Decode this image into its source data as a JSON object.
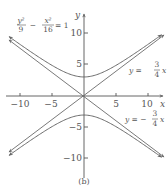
{
  "chart_data": {
    "type": "line",
    "title": "",
    "caption": "(b)",
    "xlabel": "x",
    "ylabel": "y",
    "xlim": [
      -12,
      12.5
    ],
    "ylim": [
      -12,
      12.5
    ],
    "x_ticks": [
      -10,
      -5,
      5,
      10
    ],
    "x_tick_labels": [
      "−10",
      "−5",
      "5",
      "10"
    ],
    "y_ticks": [
      10,
      5,
      -5,
      -10
    ],
    "y_tick_labels": [
      "10",
      "5",
      "−5",
      "−10"
    ],
    "grid": false,
    "series": [
      {
        "name": "y^2/9 - x^2/16 = 1",
        "kind": "hyperbola",
        "a": 3,
        "b": 4,
        "branches": [
          "upper",
          "lower"
        ],
        "vertices": [
          [
            0,
            3
          ],
          [
            0,
            -3
          ]
        ]
      },
      {
        "name": "y = (3/4)x",
        "kind": "asymptote",
        "slope": 0.75,
        "intercept": 0
      },
      {
        "name": "y = -(3/4)x",
        "kind": "asymptote",
        "slope": -0.75,
        "intercept": 0
      }
    ],
    "annotations": [
      {
        "text": "y²/9 − x²/16 = 1",
        "position": "upper-left"
      },
      {
        "text": "y = (3/4)x",
        "position": "right, above x-axis"
      },
      {
        "text": "y = −(3/4)x",
        "position": "right, below x-axis"
      }
    ]
  },
  "labels": {
    "equation_y_num": "y²",
    "equation_y_den": "9",
    "equation_minus": "−",
    "equation_x_num": "x²",
    "equation_x_den": "16",
    "equation_rhs": "= 1",
    "asym_pos_prefix": "y =",
    "asym_pos_num": "3",
    "asym_pos_den": "4",
    "asym_pos_var": "x",
    "asym_neg_prefix": "y = −",
    "asym_neg_num": "3",
    "asym_neg_den": "4",
    "asym_neg_var": "x",
    "x_axis": "x",
    "y_axis": "y",
    "caption": "(b)",
    "xt_m10": "−10",
    "xt_m5": "−5",
    "xt_5": "5",
    "xt_10": "10",
    "yt_10": "10",
    "yt_5": "5",
    "yt_m5": "−5",
    "yt_m10": "−10"
  },
  "colors": {
    "curve": "#6a6a6a",
    "axis": "#555555",
    "text": "#555555"
  }
}
